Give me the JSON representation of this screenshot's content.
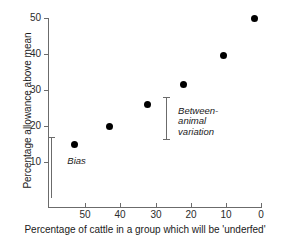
{
  "chart_data": {
    "type": "scatter",
    "title": "",
    "xlabel": "Percentage of cattle in a group which will be 'underfed'",
    "ylabel": "Percentage allowance above mean",
    "xlim": [
      56,
      0
    ],
    "ylim": [
      0,
      52
    ],
    "x_reversed": true,
    "grid": false,
    "legend": "none",
    "xticks": [
      50,
      40,
      30,
      20,
      10,
      0
    ],
    "yticks": [
      50,
      40,
      30,
      20,
      10
    ],
    "x": [
      49,
      40,
      30,
      20.5,
      10,
      2
    ],
    "y": [
      15,
      20,
      26,
      31.5,
      39.5,
      50
    ],
    "points": [
      {
        "x": 49,
        "y": 15
      },
      {
        "x": 40,
        "y": 20
      },
      {
        "x": 30,
        "y": 26
      },
      {
        "x": 20.5,
        "y": 31.5
      },
      {
        "x": 10,
        "y": 39.5
      },
      {
        "x": 2,
        "y": 50
      }
    ],
    "annotations": [
      {
        "label": "Bias",
        "x": 55,
        "y_low": 0,
        "y_high": 17,
        "text_x": 52,
        "text_y": 10
      },
      {
        "label": "Between-\nanimal\nvariation",
        "x": 25,
        "y_low": 16,
        "y_high": 28,
        "text_x": 23,
        "text_y": 24
      }
    ]
  },
  "axes": {
    "x_title": "Percentage of cattle in a group which will be 'underfed'",
    "y_title": "Percentage allowance above mean",
    "x_tick_labels": [
      "50",
      "40",
      "30",
      "20",
      "10",
      "0"
    ],
    "y_tick_labels": [
      "50",
      "40",
      "30",
      "20",
      "10"
    ]
  },
  "annotations": {
    "bias_label": "Bias",
    "between_animal_label": "Between-\nanimal\nvariation"
  },
  "colors": {
    "point": "#000000",
    "axis": "#6b6b6b",
    "text": "#1a1a1a",
    "background": "#ffffff"
  }
}
